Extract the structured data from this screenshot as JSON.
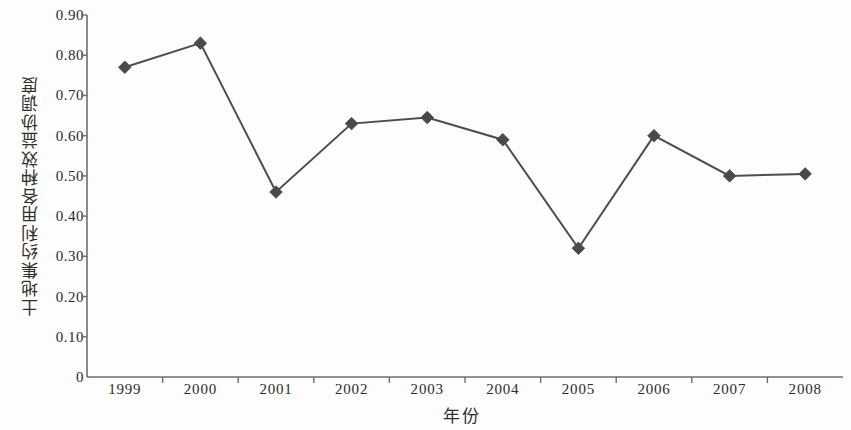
{
  "chart_data": {
    "type": "line",
    "title": "",
    "xlabel": "年份",
    "ylabel": "土地集约利用各种效益协调度",
    "categories": [
      "1999",
      "2000",
      "2001",
      "2002",
      "2003",
      "2004",
      "2005",
      "2006",
      "2007",
      "2008"
    ],
    "values": [
      0.77,
      0.83,
      0.46,
      0.63,
      0.645,
      0.59,
      0.32,
      0.6,
      0.5,
      0.505
    ],
    "series": [
      {
        "name": "土地集约利用各种效益协调度",
        "values": [
          0.77,
          0.83,
          0.46,
          0.63,
          0.645,
          0.59,
          0.32,
          0.6,
          0.5,
          0.505
        ]
      }
    ],
    "ylim": [
      0,
      0.9
    ],
    "ytick_labels": [
      "0.90",
      "0.80",
      "0.70",
      "0.60",
      "0.50",
      "0.40",
      "0.30",
      "0.20",
      "0.10",
      "0"
    ],
    "ytick_values": [
      0.9,
      0.8,
      0.7,
      0.6,
      0.5,
      0.4,
      0.3,
      0.2,
      0.1,
      0
    ],
    "grid": false,
    "legend": "none",
    "marker": "diamond",
    "line_color": "#4d4d4d",
    "marker_color": "#4a4a4a",
    "axis_color": "#6e6e6e"
  }
}
